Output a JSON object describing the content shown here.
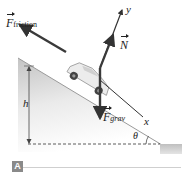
{
  "figure": {
    "panel_label": "A",
    "labels": {
      "friction_symbol": "F",
      "friction_sub": "friction",
      "normal_symbol": "N",
      "grav_symbol": "F",
      "grav_sub": "grav",
      "x_axis": "x",
      "y_axis": "y",
      "height": "h",
      "angle": "θ"
    },
    "colors": {
      "ground": "#c8c8c8",
      "arrow": "#3a3a3a",
      "car": "#e6e6e6"
    }
  }
}
